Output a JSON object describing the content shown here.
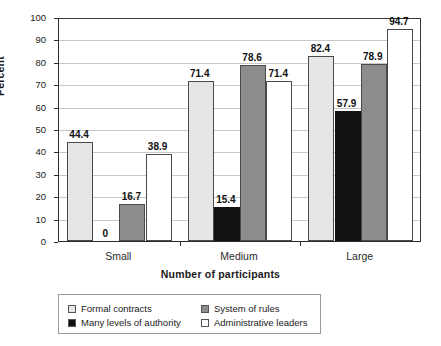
{
  "chart_data": {
    "type": "bar",
    "title": "",
    "xlabel": "Number of participants",
    "ylabel": "Percent",
    "ylim": [
      0,
      100
    ],
    "ytick_step": 10,
    "yticks": [
      "0",
      "10",
      "20",
      "30",
      "40",
      "50",
      "60",
      "70",
      "80",
      "90",
      "100"
    ],
    "grid": true,
    "legend_position": "bottom",
    "categories": [
      "Small",
      "Medium",
      "Large"
    ],
    "series": [
      {
        "name": "Formal contracts",
        "color": "#e6e6e6",
        "values": [
          44.4,
          71.4,
          82.4
        ],
        "labels": [
          "44.4",
          "71.4",
          "82.4"
        ]
      },
      {
        "name": "Many levels of authority",
        "color": "#111111",
        "values": [
          0,
          15.4,
          57.9
        ],
        "labels": [
          "0",
          "15.4",
          "57.9"
        ]
      },
      {
        "name": "System of rules",
        "color": "#8c8c8c",
        "values": [
          16.7,
          78.6,
          78.9
        ],
        "labels": [
          "16.7",
          "78.6",
          "78.9"
        ]
      },
      {
        "name": "Administrative leaders",
        "color": "#ffffff",
        "values": [
          38.9,
          71.4,
          94.7
        ],
        "labels": [
          "38.9",
          "71.4",
          "94.7"
        ]
      }
    ]
  },
  "legend": {
    "entries": [
      {
        "label": "Formal contracts",
        "color": "#e6e6e6"
      },
      {
        "label": "System of rules",
        "color": "#8c8c8c"
      },
      {
        "label": "Many levels of authority",
        "color": "#111111"
      },
      {
        "label": "Administrative leaders",
        "color": "#ffffff"
      }
    ]
  }
}
